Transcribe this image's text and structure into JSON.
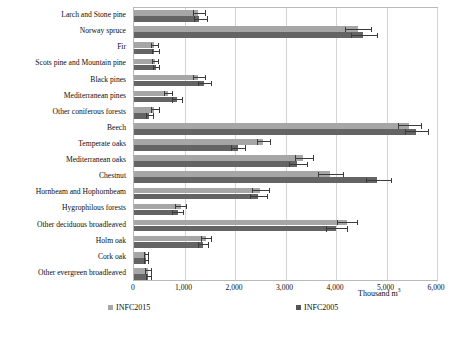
{
  "chart_data": {
    "type": "bar",
    "orientation": "horizontal",
    "title": "",
    "xlabel": "Thousand m3",
    "ylabel": "",
    "xlim": [
      0,
      6000
    ],
    "xticks": [
      0,
      1000,
      2000,
      3000,
      4000,
      5000,
      6000
    ],
    "xtick_labels": [
      "0",
      "1,000",
      "2,000",
      "3,000",
      "4,000",
      "5,000",
      "6,000"
    ],
    "grid": true,
    "legend_position": "bottom",
    "categories": [
      "Larch and Stone pine",
      "Norway spruce",
      "Fir",
      "Scots pine and Mountain pine",
      "Black pines",
      "Mediterranean pines",
      "Other coniferous forests",
      "Beech",
      "Temperate oaks",
      "Mediterranean oaks",
      "Chestnut",
      "Hornbeam and Hophornbeam",
      "Hygrophilous forests",
      "Other deciduous broadleaved",
      "Holm oak",
      "Cork oak",
      "Other evergreen broadleaved"
    ],
    "series": [
      {
        "name": "INFC2015",
        "color": "#a6a6a6",
        "values": [
          1265,
          4430,
          390,
          410,
          1265,
          670,
          400,
          5450,
          2560,
          3350,
          3880,
          2500,
          925,
          4210,
          1420,
          230,
          270
        ],
        "error_low": [
          1160,
          4180,
          340,
          360,
          1160,
          600,
          330,
          5230,
          2430,
          3180,
          3650,
          2340,
          820,
          4010,
          1330,
          190,
          220
        ],
        "error_high": [
          1410,
          4700,
          470,
          470,
          1410,
          760,
          500,
          5680,
          2700,
          3540,
          4130,
          2680,
          1030,
          4420,
          1530,
          280,
          330
        ]
      },
      {
        "name": "INFC2005",
        "color": "#646464",
        "values": [
          1290,
          4530,
          400,
          430,
          1380,
          845,
          300,
          5590,
          2050,
          3230,
          4820,
          2460,
          865,
          4000,
          1360,
          230,
          280
        ],
        "error_low": [
          1180,
          4290,
          350,
          375,
          1270,
          760,
          245,
          5360,
          1930,
          3060,
          4590,
          2300,
          760,
          3810,
          1270,
          195,
          230
        ],
        "error_high": [
          1450,
          4810,
          490,
          500,
          1530,
          960,
          385,
          5830,
          2190,
          3420,
          5080,
          2640,
          980,
          4220,
          1470,
          280,
          345
        ]
      }
    ]
  },
  "legend": {
    "items": [
      {
        "label": "INFC2015"
      },
      {
        "label": "INFC2005"
      }
    ]
  },
  "axis_title": {
    "text": "Thousand m",
    "superscript": "3"
  }
}
